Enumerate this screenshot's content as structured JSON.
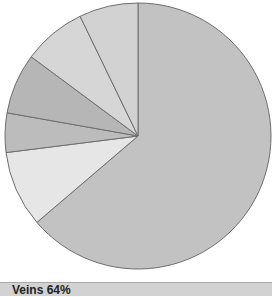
{
  "chart_data": {
    "type": "pie",
    "title": "",
    "start": "12 o'clock",
    "direction": "clockwise",
    "slices": [
      {
        "label": "Veins",
        "value": 64,
        "color": "#c2c2c2"
      },
      {
        "label": "",
        "value": 9.3,
        "color": "#e6e6e6"
      },
      {
        "label": "",
        "value": 4.8,
        "color": "#bcbcbc"
      },
      {
        "label": "",
        "value": 7.4,
        "color": "#b6b6b6"
      },
      {
        "label": "",
        "value": 7.7,
        "color": "#d6d6d6"
      },
      {
        "label": "",
        "value": 7.2,
        "color": "#d2d2d2"
      }
    ],
    "legend": {
      "placement": "bottom",
      "text": "Veins 64%"
    }
  }
}
